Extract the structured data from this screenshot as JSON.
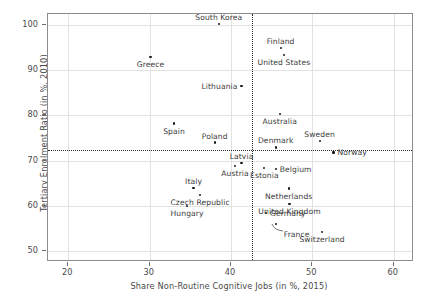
{
  "chart_data": {
    "type": "scatter",
    "title": "",
    "xlabel": "Share Non-Routine Cognitive Jobs (in %, 2015)",
    "ylabel": "Tertiary Enrolment Ratio (in %, 2010)",
    "xlim": [
      17.5,
      62.5
    ],
    "ylim": [
      47.5,
      102.5
    ],
    "xticks": [
      20,
      30,
      40,
      50,
      60
    ],
    "yticks": [
      50,
      60,
      70,
      80,
      90,
      100
    ],
    "xtick_labels": [
      "20",
      "30",
      "40",
      "50",
      "60"
    ],
    "ytick_labels": [
      "50",
      "60",
      "70",
      "80",
      "90",
      "100"
    ],
    "grid": true,
    "legend": "none",
    "reference_lines": {
      "vertical_x": 42.6,
      "horizontal_y": 72.4,
      "style": "dotted"
    },
    "points": [
      {
        "label": "South Korea",
        "x": 38.5,
        "y": 100.2,
        "label_pos": "above"
      },
      {
        "label": "Finland",
        "x": 46.1,
        "y": 94.9,
        "label_pos": "above"
      },
      {
        "label": "United States",
        "x": 46.5,
        "y": 93.4,
        "label_pos": "below"
      },
      {
        "label": "Greece",
        "x": 30.1,
        "y": 93.0,
        "label_pos": "below"
      },
      {
        "label": "Lithuania",
        "x": 41.3,
        "y": 86.5,
        "label_pos": "left"
      },
      {
        "label": "Australia",
        "x": 46.0,
        "y": 80.4,
        "label_pos": "below"
      },
      {
        "label": "Spain",
        "x": 33.0,
        "y": 78.2,
        "label_pos": "below"
      },
      {
        "label": "Sweden",
        "x": 50.9,
        "y": 74.4,
        "label_pos": "above"
      },
      {
        "label": "Poland",
        "x": 38.0,
        "y": 74.0,
        "label_pos": "above"
      },
      {
        "label": "Denmark",
        "x": 45.5,
        "y": 72.9,
        "label_pos": "above"
      },
      {
        "label": "Norway",
        "x": 52.6,
        "y": 71.8,
        "label_pos": "right"
      },
      {
        "label": "Latvia",
        "x": 41.3,
        "y": 69.5,
        "label_pos": "above"
      },
      {
        "label": "Austria",
        "x": 40.5,
        "y": 68.8,
        "label_pos": "below"
      },
      {
        "label": "Estonia",
        "x": 44.1,
        "y": 68.4,
        "label_pos": "below"
      },
      {
        "label": "Belgium",
        "x": 45.5,
        "y": 68.2,
        "label_pos": "right"
      },
      {
        "label": "Italy",
        "x": 35.4,
        "y": 64.0,
        "label_pos": "above"
      },
      {
        "label": "Netherlands",
        "x": 47.1,
        "y": 63.8,
        "label_pos": "below"
      },
      {
        "label": "Czech Republic",
        "x": 36.2,
        "y": 62.3,
        "label_pos": "below"
      },
      {
        "label": "United Kingdom",
        "x": 47.2,
        "y": 60.3,
        "label_pos": "below"
      },
      {
        "label": "Hungary",
        "x": 34.6,
        "y": 60.0,
        "label_pos": "below"
      },
      {
        "label": "Germany",
        "x": 44.3,
        "y": 58.3,
        "label_pos": "right"
      },
      {
        "label": "France",
        "x": 45.5,
        "y": 56.0,
        "label_pos": "leader"
      },
      {
        "label": "Switzerland",
        "x": 51.2,
        "y": 54.1,
        "label_pos": "below"
      }
    ]
  },
  "axes": {
    "x_title": "Share Non-Routine Cognitive Jobs (in %, 2015)",
    "y_title": "Tertiary Enrolment Ratio (in %, 2010)"
  }
}
